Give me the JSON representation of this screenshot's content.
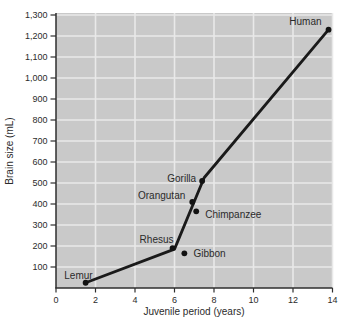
{
  "chart_data": {
    "type": "line",
    "title": "",
    "xlabel": "Juvenile period (years)",
    "ylabel": "Brain size (mL)",
    "xlim": [
      0,
      14
    ],
    "ylim": [
      0,
      1300
    ],
    "grid": true,
    "legend": "none",
    "plot_bg_color": "#c9c9c9",
    "grid_color": "#e9e9e9",
    "axis_color": "#2e2e2e",
    "line_color": "#1a1a1a",
    "point_color": "#121212",
    "text_color": "#2b2b2b",
    "x_ticks": {
      "values": [
        0,
        2,
        4,
        6,
        8,
        10,
        12,
        14
      ],
      "labels": [
        "0",
        "2",
        "4",
        "6",
        "8",
        "10",
        "12",
        "14"
      ]
    },
    "y_ticks": {
      "values": [
        100,
        200,
        300,
        400,
        500,
        600,
        700,
        800,
        900,
        1000,
        1100,
        1200,
        1300
      ],
      "labels": [
        "100",
        "200",
        "300",
        "400",
        "500",
        "600",
        "700",
        "800",
        "900",
        "1,000",
        "1,100",
        "1,200",
        "1,300"
      ]
    },
    "points": [
      {
        "name": "Lemur",
        "x": 1.5,
        "y": 25,
        "label_anchor": "end",
        "label_offset": [
          7,
          -4
        ]
      },
      {
        "name": "Rhesus",
        "x": 5.9,
        "y": 190,
        "label_anchor": "end",
        "label_offset": [
          1,
          -5
        ]
      },
      {
        "name": "Gibbon",
        "x": 6.5,
        "y": 165,
        "label_anchor": "start",
        "label_offset": [
          9,
          4
        ]
      },
      {
        "name": "Orangutan",
        "x": 6.9,
        "y": 410,
        "label_anchor": "end",
        "label_offset": [
          -7,
          -3
        ]
      },
      {
        "name": "Chimpanzee",
        "x": 7.1,
        "y": 365,
        "label_anchor": "start",
        "label_offset": [
          9,
          7
        ]
      },
      {
        "name": "Gorilla",
        "x": 7.4,
        "y": 510,
        "label_anchor": "end",
        "label_offset": [
          -6,
          1
        ]
      },
      {
        "name": "Human",
        "x": 13.8,
        "y": 1230,
        "label_anchor": "end",
        "label_offset": [
          -7,
          -5
        ]
      }
    ],
    "line_path": [
      [
        1.5,
        25
      ],
      [
        6.0,
        185
      ],
      [
        7.5,
        525
      ],
      [
        13.8,
        1230
      ]
    ]
  }
}
